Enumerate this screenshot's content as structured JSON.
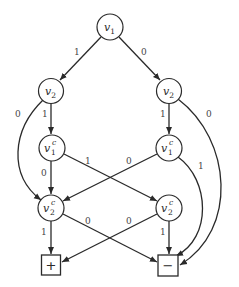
{
  "diagram": {
    "type": "binary-decision-diagram",
    "nodes": [
      {
        "id": "n_v1",
        "var": "v",
        "sub": "1",
        "sup": "",
        "x": 110,
        "y": 27,
        "shape": "circle"
      },
      {
        "id": "n_v2_left",
        "var": "v",
        "sub": "2",
        "sup": "",
        "x": 51,
        "y": 91,
        "shape": "circle"
      },
      {
        "id": "n_v2_right",
        "var": "v",
        "sub": "2",
        "sup": "",
        "x": 169,
        "y": 91,
        "shape": "circle"
      },
      {
        "id": "n_v1c_left",
        "var": "v",
        "sub": "1",
        "sup": "c",
        "x": 52,
        "y": 148,
        "shape": "circle"
      },
      {
        "id": "n_v1c_right",
        "var": "v",
        "sub": "1",
        "sup": "c",
        "x": 169,
        "y": 148,
        "shape": "circle"
      },
      {
        "id": "n_v2c_left",
        "var": "v",
        "sub": "2",
        "sup": "c",
        "x": 51,
        "y": 208,
        "shape": "circle"
      },
      {
        "id": "n_v2c_right",
        "var": "v",
        "sub": "2",
        "sup": "c",
        "x": 169,
        "y": 208,
        "shape": "circle"
      },
      {
        "id": "t_plus",
        "label": "+",
        "x": 51,
        "y": 265,
        "shape": "box"
      },
      {
        "id": "t_minus",
        "label": "−",
        "x": 168,
        "y": 265,
        "shape": "box"
      }
    ],
    "edges": [
      {
        "from": "n_v1",
        "to": "n_v2_left",
        "label": "1",
        "label_x": 77,
        "label_y": 55
      },
      {
        "from": "n_v1",
        "to": "n_v2_right",
        "label": "0",
        "label_x": 142,
        "label_y": 55
      },
      {
        "from": "n_v2_left",
        "to": "n_v1c_left",
        "label": "1",
        "label_x": 43,
        "label_y": 117
      },
      {
        "from": "n_v2_left",
        "to": "n_v2c_left",
        "label": "0",
        "label_x": 16,
        "label_y": 117
      },
      {
        "from": "n_v2_right",
        "to": "n_v1c_right",
        "label": "1",
        "label_x": 161,
        "label_y": 117
      },
      {
        "from": "n_v2_right",
        "to": "t_minus",
        "label": "0",
        "label_x": 207,
        "label_y": 117
      },
      {
        "from": "n_v1c_left",
        "to": "n_v2c_left",
        "label": "0",
        "label_x": 42,
        "label_y": 176
      },
      {
        "from": "n_v1c_left",
        "to": "n_v2c_right",
        "label": "1",
        "label_x": 86,
        "label_y": 164
      },
      {
        "from": "n_v1c_right",
        "to": "n_v2c_left",
        "label": "0",
        "label_x": 127,
        "label_y": 164
      },
      {
        "from": "n_v1c_right",
        "to": "t_minus",
        "label": "1",
        "label_x": 199,
        "label_y": 169
      },
      {
        "from": "n_v2c_left",
        "to": "t_plus",
        "label": "1",
        "label_x": 42,
        "label_y": 235
      },
      {
        "from": "n_v2c_left",
        "to": "t_minus",
        "label": "0",
        "label_x": 86,
        "label_y": 224
      },
      {
        "from": "n_v2c_right",
        "to": "t_plus",
        "label": "0",
        "label_x": 127,
        "label_y": 224
      },
      {
        "from": "n_v2c_right",
        "to": "t_minus",
        "label": "1",
        "label_x": 161,
        "label_y": 235
      }
    ]
  },
  "labels": {
    "v1": {
      "var": "v",
      "sub": "1"
    },
    "v2_left": {
      "var": "v",
      "sub": "2"
    },
    "v2_right": {
      "var": "v",
      "sub": "2"
    },
    "v1c_left": {
      "var": "v",
      "sub": "1",
      "sup": "c"
    },
    "v1c_right": {
      "var": "v",
      "sub": "1",
      "sup": "c"
    },
    "v2c_left": {
      "var": "v",
      "sub": "2",
      "sup": "c"
    },
    "v2c_right": {
      "var": "v",
      "sub": "2",
      "sup": "c"
    },
    "plus": "+",
    "minus": "−",
    "e_v1_v2l": "1",
    "e_v1_v2r": "0",
    "e_v2l_v1cl": "1",
    "e_v2l_v2cl": "0",
    "e_v2r_v1cr": "1",
    "e_v2r_minus": "0",
    "e_v1cl_v2cl": "0",
    "e_v1cl_v2cr": "1",
    "e_v1cr_v2cl": "0",
    "e_v1cr_minus": "1",
    "e_v2cl_plus": "1",
    "e_v2cl_minus": "0",
    "e_v2cr_plus": "0",
    "e_v2cr_minus": "1"
  }
}
